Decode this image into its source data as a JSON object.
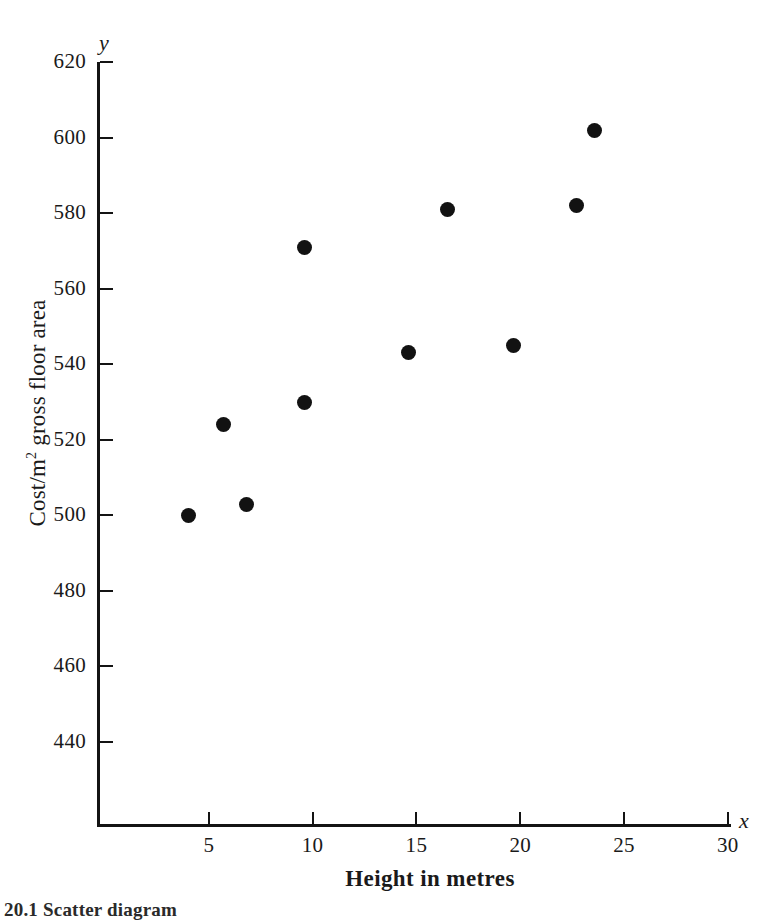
{
  "chart_data": {
    "type": "scatter",
    "title": "",
    "xlabel": "Height in metres",
    "ylabel": "Cost/m2 gross floor area",
    "ylabel_prefix": "Cost/m",
    "ylabel_sup": "2",
    "ylabel_suffix": " gross floor area",
    "x_var": "x",
    "y_var": "y",
    "xlim": [
      0,
      30
    ],
    "ylim": [
      430,
      620
    ],
    "xticks": [
      5,
      10,
      15,
      20,
      25,
      30
    ],
    "yticks": [
      440,
      460,
      480,
      500,
      520,
      540,
      560,
      580,
      600,
      620
    ],
    "grid": false,
    "legend": null,
    "marker": "filled-circle",
    "marker_color": "#121212",
    "points": [
      {
        "x": 4.0,
        "y": 500
      },
      {
        "x": 5.7,
        "y": 524
      },
      {
        "x": 6.8,
        "y": 503
      },
      {
        "x": 9.6,
        "y": 530
      },
      {
        "x": 9.6,
        "y": 571
      },
      {
        "x": 14.6,
        "y": 543
      },
      {
        "x": 16.5,
        "y": 581
      },
      {
        "x": 19.7,
        "y": 545
      },
      {
        "x": 22.7,
        "y": 582
      },
      {
        "x": 23.6,
        "y": 602
      }
    ]
  },
  "caption": "20.1  Scatter diagram"
}
